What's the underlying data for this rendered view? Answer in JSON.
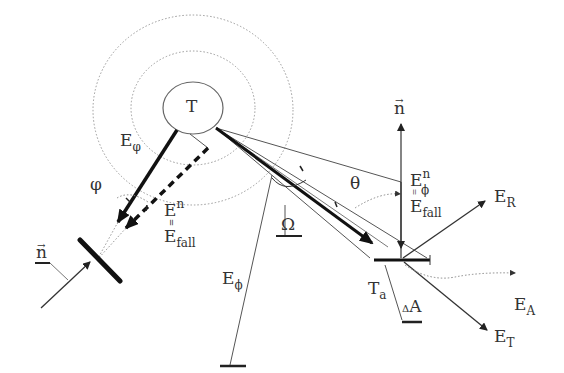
{
  "diagram": {
    "labels": {
      "target": "T",
      "e_phi_top": "E",
      "e_phi_top_sub": "φ",
      "phi_angle": "φ",
      "left_normal": "n",
      "left_en": "E",
      "left_en_sup": "n",
      "left_eq": "=",
      "left_efall": "E",
      "left_efall_sub": "fall",
      "e_phi_bottom": "E",
      "e_phi_bottom_sub": "ϕ",
      "omega": "Ω",
      "theta": "θ",
      "right_normal": "n",
      "right_en": "E",
      "right_en_sup": "n",
      "right_en_sub": "ϕ",
      "right_eq": "=",
      "right_efall": "E",
      "right_efall_sub": "fall",
      "e_r": "E",
      "e_r_sub": "R",
      "t_a": "T",
      "t_a_sub": "a",
      "delta_a_delta": "Δ",
      "delta_a": "A",
      "e_a": "E",
      "e_a_sub": "A",
      "e_t": "E",
      "e_t_sub": "T"
    },
    "colors": {
      "line": "#222222",
      "thin": "#555555",
      "dotted": "#888888",
      "text": "#333333"
    }
  }
}
